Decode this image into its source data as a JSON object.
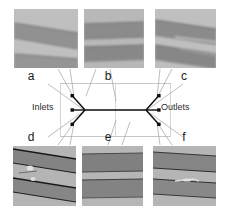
{
  "figure": {
    "kind": "microfluidic-device-schematic-with-micrographs",
    "width": 231,
    "height": 212,
    "background_color": "#ffffff"
  },
  "schematic": {
    "inlets_label": "Inlets",
    "outlets_label": "Outlets",
    "inlet_count": 3,
    "outlet_count": 3,
    "line_color": "#000000",
    "guide_color": "#b9b9b9",
    "leader_color": "#9a9a9a",
    "node_color": "#000000",
    "junction_left": {
      "x": 85,
      "y": 110
    },
    "junction_right": {
      "x": 146,
      "y": 110
    },
    "inlet_ports": [
      {
        "x": 72,
        "y": 96
      },
      {
        "x": 72,
        "y": 110
      },
      {
        "x": 72,
        "y": 124
      }
    ],
    "outlet_ports": [
      {
        "x": 159,
        "y": 96
      },
      {
        "x": 159,
        "y": 110
      },
      {
        "x": 159,
        "y": 124
      }
    ]
  },
  "panels": [
    {
      "id": "a",
      "caption": "a",
      "row": "top",
      "x": 14,
      "y": 9,
      "w": 64,
      "h": 59,
      "caption_x": 31,
      "caption_y": 71,
      "description": "two dark diagonal channel bands sloping down to the right on a light grey background",
      "background": "#b9b9b9",
      "bands": [
        {
          "y_left": 16,
          "y_right": 26,
          "thickness": 15,
          "color": "#8b8b8b"
        },
        {
          "y_left": 45,
          "y_right": 50,
          "thickness": 16,
          "color": "#8f8f8f"
        }
      ],
      "focus": "blurred"
    },
    {
      "id": "b",
      "caption": "b",
      "row": "top",
      "x": 84,
      "y": 9,
      "w": 60,
      "h": 59,
      "caption_x": 101,
      "caption_y": 71,
      "description": "two near-horizontal dark channel bands, slightly blurred",
      "background": "#b5b5b5",
      "bands": [
        {
          "y_left": 17,
          "y_right": 15,
          "thickness": 14,
          "color": "#8a8a8a"
        },
        {
          "y_left": 39,
          "y_right": 37,
          "thickness": 14,
          "color": "#878787"
        }
      ],
      "focus": "blurred"
    },
    {
      "id": "c",
      "caption": "c",
      "row": "top",
      "x": 155,
      "y": 9,
      "w": 61,
      "h": 59,
      "caption_x": 177,
      "caption_y": 71,
      "description": "two dark channel bands sloping down to the right with thin bright streaks inside",
      "background": "#bcbcbc",
      "bands": [
        {
          "y_left": 12,
          "y_right": 20,
          "thickness": 16,
          "color": "#8a8a8a"
        },
        {
          "y_left": 36,
          "y_right": 44,
          "thickness": 15,
          "color": "#868686"
        }
      ],
      "focus": "blurred"
    },
    {
      "id": "d",
      "caption": "d",
      "row": "bottom",
      "x": 13,
      "y": 146,
      "w": 63,
      "h": 60,
      "caption_x": 31,
      "caption_y": 132,
      "description": "sharp dark channel edges sloping down to the right with a bright particle defect near the left centre",
      "background": "#b0b0b0",
      "bands": [
        {
          "y_left": 4,
          "y_right": 14,
          "thickness": 14,
          "color": "#7f7f7f"
        },
        {
          "y_left": 32,
          "y_right": 42,
          "thickness": 14,
          "color": "#828282"
        }
      ],
      "focus": "sharp",
      "has_defect": true
    },
    {
      "id": "e",
      "caption": "e",
      "row": "bottom",
      "x": 82,
      "y": 146,
      "w": 61,
      "h": 60,
      "caption_x": 101,
      "caption_y": 132,
      "description": "two crisp horizontal dark channel bands",
      "background": "#b3b3b3",
      "bands": [
        {
          "y_left": 8,
          "y_right": 7,
          "thickness": 17,
          "color": "#7d7d7d"
        },
        {
          "y_left": 34,
          "y_right": 33,
          "thickness": 17,
          "color": "#808080"
        }
      ],
      "focus": "sharp",
      "has_defect": false
    },
    {
      "id": "f",
      "caption": "f",
      "row": "bottom",
      "x": 153,
      "y": 146,
      "w": 63,
      "h": 60,
      "caption_x": 177,
      "caption_y": 132,
      "description": "dark channel bands with thin dark lines and a small bright defect at mid-height",
      "background": "#b2b2b2",
      "bands": [
        {
          "y_left": 7,
          "y_right": 11,
          "thickness": 16,
          "color": "#828282"
        },
        {
          "y_left": 34,
          "y_right": 38,
          "thickness": 15,
          "color": "#858585"
        }
      ],
      "focus": "sharp",
      "has_defect": true
    }
  ]
}
